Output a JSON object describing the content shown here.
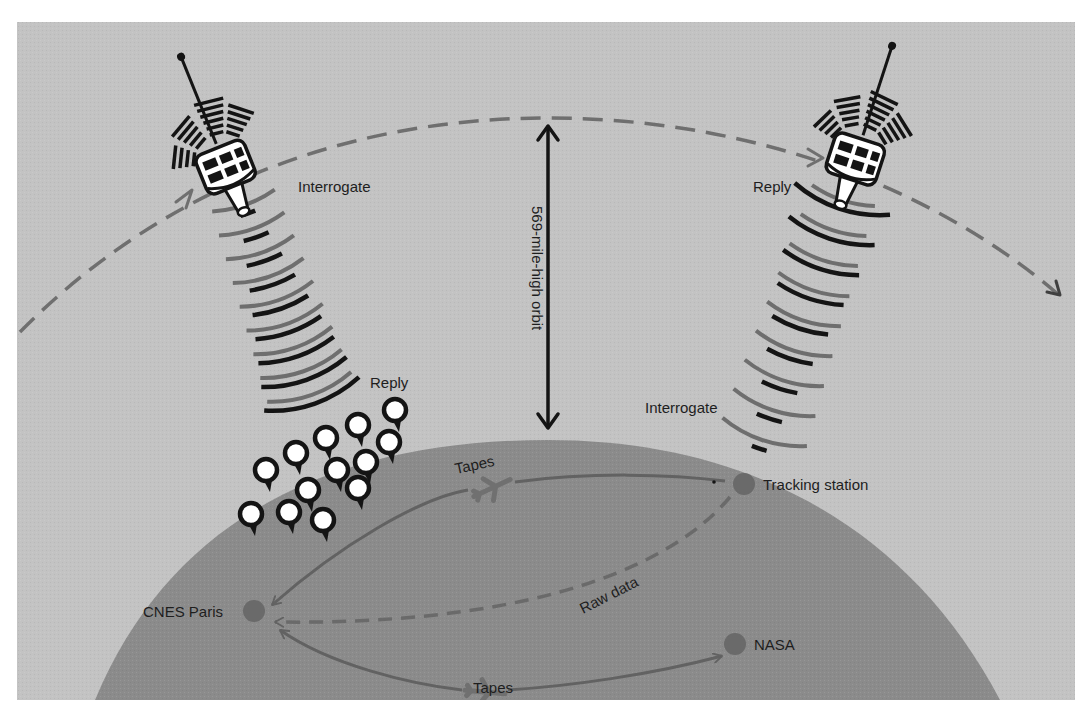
{
  "diagram": {
    "orbit_label": "569-mile-high orbit",
    "colors": {
      "sky": "#c3c3c3",
      "earth": "#8b8b8b",
      "orbit_dash": "#6f6f6f",
      "wave_dark": "#141414",
      "wave_gray": "#6e6e6e",
      "node": "#6a6a6a",
      "flow": "#626262",
      "label": "#1e1e1e"
    },
    "satellites": [
      {
        "id": "satellite-left",
        "labels": {
          "interrogate": "Interrogate",
          "reply": "Reply"
        }
      },
      {
        "id": "satellite-right",
        "labels": {
          "reply": "Reply",
          "interrogate": "Interrogate"
        }
      }
    ],
    "nodes": [
      {
        "id": "tracking-station",
        "label": "Tracking station"
      },
      {
        "id": "cnes-paris",
        "label": "CNES Paris"
      },
      {
        "id": "nasa",
        "label": "NASA"
      }
    ],
    "flows": [
      {
        "id": "tapes-upper",
        "label": "Tapes",
        "from": "cnes-paris",
        "to": "tracking-station",
        "style": "solid",
        "via": "airplane"
      },
      {
        "id": "raw-data",
        "label": "Raw data",
        "from": "tracking-station",
        "to": "cnes-paris",
        "style": "dashed"
      },
      {
        "id": "tapes-lower",
        "label": "Tapes",
        "from": "cnes-paris",
        "to": "nasa",
        "style": "solid",
        "via": "airplane"
      }
    ],
    "beacon_count": 14
  }
}
